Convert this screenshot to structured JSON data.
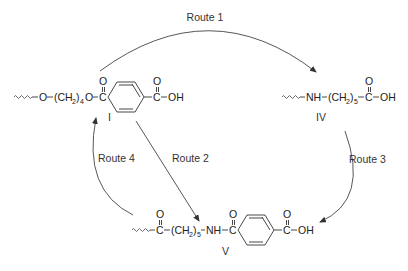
{
  "diagram": {
    "type": "reaction-scheme",
    "compounds": {
      "I": {
        "label": "I",
        "parts": {
          "o1": "O",
          "ch2_open": "(CH",
          "ch2_sub": "2",
          "ch2_close": ")",
          "n_sub": "4",
          "o2": "O",
          "c1": "C",
          "o_dbl1": "O",
          "c2": "C",
          "o_dbl2": "O",
          "oh": "OH"
        }
      },
      "IV": {
        "label": "IV",
        "parts": {
          "nh": "NH",
          "ch2_open": "(CH",
          "ch2_sub": "2",
          "ch2_close": ")",
          "n_sub": "5",
          "c": "C",
          "o_dbl": "O",
          "oh": "OH"
        }
      },
      "V": {
        "label": "V",
        "parts": {
          "c1": "C",
          "o_dbl1": "O",
          "ch2_open": "(CH",
          "ch2_sub": "2",
          "ch2_close": ")",
          "n_sub": "5",
          "nh": "NH",
          "c2": "C",
          "o_dbl2": "O",
          "c3": "C",
          "o_dbl3": "O",
          "oh": "OH"
        }
      }
    },
    "routes": [
      {
        "label": "Route 1",
        "from": "I",
        "to": "IV"
      },
      {
        "label": "Route 2",
        "from": "I",
        "to": "V"
      },
      {
        "label": "Route 3",
        "from": "IV",
        "to": "V"
      },
      {
        "label": "Route 4",
        "from": "V",
        "to": "I"
      }
    ]
  }
}
